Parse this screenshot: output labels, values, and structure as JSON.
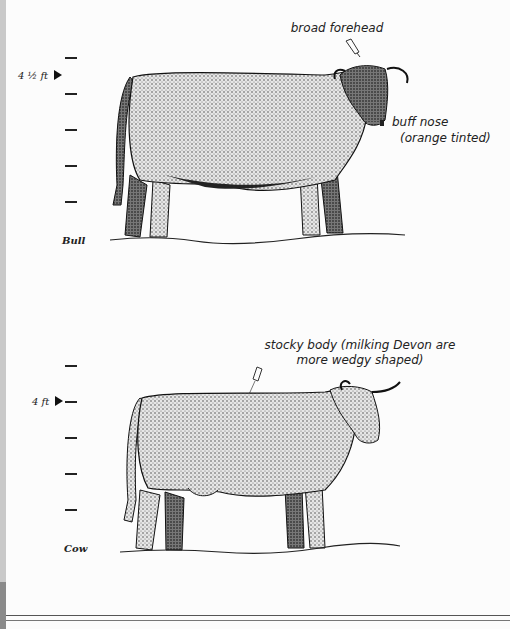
{
  "page": {
    "left_strip_color": "#c9c9c9",
    "left_strip_dark_color": "#8a8a8a"
  },
  "bull": {
    "label": "Bull",
    "height_marker": "4 ½ ft",
    "scale_ticks": 5,
    "annotations": [
      {
        "id": "forehead",
        "text": "broad forehead"
      },
      {
        "id": "nose",
        "line1": "buff nose",
        "line2": "(orange tinted)"
      }
    ]
  },
  "cow": {
    "label": "Cow",
    "height_marker": "4 ft",
    "scale_ticks": 5,
    "annotations": [
      {
        "id": "body",
        "line1": "stocky body (milking Devon are",
        "line2": "more wedgy shaped)"
      }
    ]
  }
}
